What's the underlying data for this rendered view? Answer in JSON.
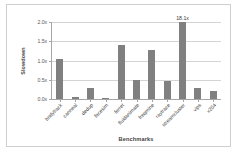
{
  "chart_data": {
    "type": "bar",
    "title": "",
    "xlabel": "Benchmarks",
    "ylabel": "Slowdown",
    "categories": [
      "bodytrack",
      "canneal",
      "dedup",
      "facesim",
      "ferret",
      "fluidanimate",
      "freqmine",
      "raytrace",
      "streamcluster",
      "vips",
      "x264"
    ],
    "values": [
      1.05,
      0.05,
      0.28,
      0.02,
      1.4,
      0.5,
      1.28,
      0.47,
      18.1,
      0.28,
      0.2
    ],
    "annotations": [
      {
        "category": "streamcluster",
        "text": "18.1x",
        "clipped": true
      }
    ],
    "ylim": [
      0.0,
      2.0
    ],
    "yticks": [
      0.0,
      0.5,
      1.0,
      1.5,
      2.0
    ],
    "ytick_labels": [
      "0.0x",
      "0.5x",
      "1.0x",
      "1.5x",
      "2.0x"
    ],
    "grid": true,
    "legend": false,
    "bar_color": "#808080",
    "gridline_color": "#d4d4d4",
    "axis_color": "#a6a6a6"
  }
}
